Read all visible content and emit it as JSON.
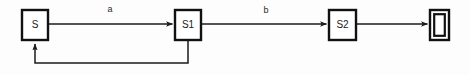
{
  "diagram": {
    "type": "finite-state-machine",
    "title": "",
    "background_color": "#fdfdfd",
    "stroke_color": "#111111",
    "states": [
      {
        "id": "S",
        "label": "S",
        "kind": "normal",
        "x": 22,
        "y": 10,
        "w": 26,
        "h": 30
      },
      {
        "id": "S1",
        "label": "S1",
        "kind": "normal",
        "x": 175,
        "y": 10,
        "w": 26,
        "h": 30
      },
      {
        "id": "S2",
        "label": "S2",
        "kind": "normal",
        "x": 329,
        "y": 10,
        "w": 27,
        "h": 30
      },
      {
        "id": "ACCEPT",
        "label": "",
        "kind": "accept",
        "x": 430,
        "y": 10,
        "w": 19,
        "h": 30
      }
    ],
    "transitions": [
      {
        "from": "S",
        "to": "S1",
        "label": "a",
        "label_x": 110,
        "label_y": 10,
        "shape": "straight"
      },
      {
        "from": "S1",
        "to": "S2",
        "label": "b",
        "label_x": 266,
        "label_y": 11,
        "shape": "straight"
      },
      {
        "from": "S2",
        "to": "ACCEPT",
        "label": "",
        "label_x": 0,
        "label_y": 0,
        "shape": "straight"
      },
      {
        "from": "S1",
        "to": "S",
        "label": "",
        "label_x": 0,
        "label_y": 0,
        "shape": "feedback-loop-below"
      }
    ],
    "edge_y": 24,
    "loop_y": 63
  }
}
